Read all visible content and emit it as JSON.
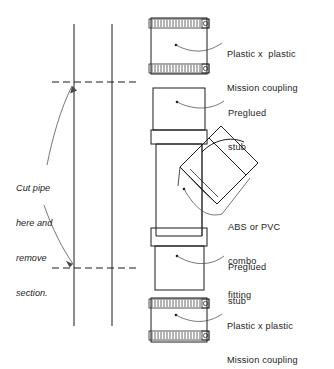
{
  "figure": {
    "background_color": "#ffffff",
    "line_color": "#1a1a1a"
  },
  "annotations": {
    "cut_note": {
      "name": "cut-pipe-instruction",
      "lines": [
        "Cut pipe",
        "here and",
        "remove",
        "section."
      ],
      "style": "italic"
    },
    "callouts": [
      {
        "name": "top-mission-coupling",
        "lines": [
          "Plastic x  plastic",
          "Mission coupling"
        ]
      },
      {
        "name": "top-preglued-stub",
        "lines": [
          "Preglued",
          "stub"
        ]
      },
      {
        "name": "combo-fitting",
        "lines": [
          "ABS or PVC",
          "combo",
          "fitting"
        ]
      },
      {
        "name": "bottom-preglued-stub",
        "lines": [
          "Preglued",
          "stub"
        ]
      },
      {
        "name": "bottom-mission-coupling",
        "lines": [
          "Plastic x plastic",
          "Mission coupling"
        ]
      }
    ]
  },
  "components": {
    "existing_pipe": {
      "name": "existing-vertical-pipe",
      "left_wall_x": 74,
      "right_wall_x": 112,
      "top_y": 24,
      "bottom_y": 326
    },
    "cut_lines": [
      {
        "name": "upper-cut-line",
        "y": 82,
        "x1": 52,
        "x2": 140,
        "style": "dashed"
      },
      {
        "name": "lower-cut-line",
        "y": 268,
        "x1": 52,
        "x2": 140,
        "style": "dashed"
      }
    ],
    "assembly": [
      {
        "name": "top-mission-coupling",
        "type": "rubber-coupling",
        "clamp_bands": 2
      },
      {
        "name": "upper-preglued-stub",
        "type": "pipe-stub"
      },
      {
        "name": "combo-fitting",
        "type": "combo-fitting",
        "branch_angle_deg": 45
      },
      {
        "name": "lower-preglued-stub",
        "type": "pipe-stub"
      },
      {
        "name": "bottom-mission-coupling",
        "type": "rubber-coupling",
        "clamp_bands": 2
      }
    ]
  }
}
